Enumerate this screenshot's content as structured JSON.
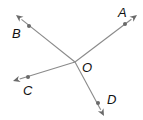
{
  "diagram": {
    "type": "rays-from-common-endpoint",
    "vertex": {
      "label": "O",
      "x": 75,
      "y": 62,
      "label_x": 82,
      "label_y": 72
    },
    "rays": [
      {
        "name": "OA",
        "label": "A",
        "tip": [
          137,
          15
        ],
        "dot": [
          125,
          24
        ],
        "label_pos": [
          118,
          17
        ]
      },
      {
        "name": "OB",
        "label": "B",
        "tip": [
          16,
          15
        ],
        "dot": [
          29,
          26
        ],
        "label_pos": [
          12,
          38
        ]
      },
      {
        "name": "OC",
        "label": "C",
        "tip": [
          13,
          81
        ],
        "dot": [
          28,
          77
        ],
        "label_pos": [
          23,
          95
        ]
      },
      {
        "name": "OD",
        "label": "D",
        "tip": [
          104,
          116
        ],
        "dot": [
          98,
          103
        ],
        "label_pos": [
          107,
          104
        ]
      }
    ],
    "colors": {
      "ray": "#8a8a8a",
      "point": "#6a6a6a",
      "label": "#111111"
    }
  }
}
